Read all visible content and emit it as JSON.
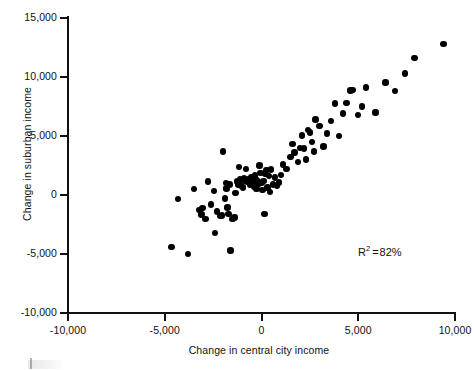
{
  "chart_data": {
    "type": "scatter",
    "title": "",
    "xlabel": "Change in central city income",
    "ylabel": "Change in suburban income",
    "xlim": [
      -10000,
      10000
    ],
    "ylim": [
      -10000,
      15000
    ],
    "grid": false,
    "legend": null,
    "xticks": [
      -10000,
      -5000,
      0,
      5000,
      10000
    ],
    "xtick_labels": [
      "-10,000",
      "-5,000",
      "0",
      "5,000",
      "10,000"
    ],
    "yticks": [
      -10000,
      -5000,
      0,
      5000,
      10000,
      15000
    ],
    "ytick_labels": [
      "-10,000",
      "-5,000",
      "0",
      "5,000",
      "10,000",
      "15,000"
    ],
    "annotations": [
      {
        "name": "r-squared",
        "prefix": "R",
        "superscript": "2",
        "equals": "=",
        "value": "82%",
        "text": "R2 = 82%",
        "x": 6000,
        "y": -3500
      }
    ],
    "marker": {
      "shape": "circle",
      "color": "#000000",
      "size": 6.4
    },
    "n_points": 93,
    "points": [
      [
        -4650,
        -4400
      ],
      [
        -4300,
        -350
      ],
      [
        -3800,
        -5000
      ],
      [
        -3500,
        500
      ],
      [
        -3200,
        -1250
      ],
      [
        -3100,
        -1650
      ],
      [
        -3050,
        -1100
      ],
      [
        -2900,
        -2050
      ],
      [
        -2750,
        1150
      ],
      [
        -2600,
        -800
      ],
      [
        -2450,
        350
      ],
      [
        -2400,
        -3200
      ],
      [
        -2300,
        -1400
      ],
      [
        -2150,
        -1800
      ],
      [
        -2050,
        -1750
      ],
      [
        -2000,
        3700
      ],
      [
        -1900,
        -300
      ],
      [
        -1850,
        1000
      ],
      [
        -1800,
        550
      ],
      [
        -1750,
        -1050
      ],
      [
        -1700,
        -1600
      ],
      [
        -1650,
        900
      ],
      [
        -1600,
        -4700
      ],
      [
        -1500,
        -2050
      ],
      [
        -1400,
        -1900
      ],
      [
        -1350,
        150
      ],
      [
        -1250,
        1150
      ],
      [
        -1200,
        900
      ],
      [
        -1150,
        2350
      ],
      [
        -1100,
        1300
      ],
      [
        -1050,
        800
      ],
      [
        -950,
        650
      ],
      [
        -900,
        1450
      ],
      [
        -850,
        1200
      ],
      [
        -800,
        2200
      ],
      [
        -750,
        1100
      ],
      [
        -700,
        1350
      ],
      [
        -650,
        1000
      ],
      [
        -600,
        850
      ],
      [
        -550,
        1500
      ],
      [
        -500,
        1250
      ],
      [
        -450,
        1100
      ],
      [
        -420,
        900
      ],
      [
        -380,
        700
      ],
      [
        -350,
        1650
      ],
      [
        -300,
        1300
      ],
      [
        -250,
        500
      ],
      [
        -200,
        1150
      ],
      [
        -150,
        950
      ],
      [
        -100,
        2500
      ],
      [
        -50,
        1850
      ],
      [
        0,
        1000
      ],
      [
        50,
        400
      ],
      [
        100,
        1200
      ],
      [
        150,
        -1600
      ],
      [
        200,
        1800
      ],
      [
        250,
        2100
      ],
      [
        300,
        650
      ],
      [
        400,
        1600
      ],
      [
        450,
        250
      ],
      [
        500,
        2150
      ],
      [
        600,
        900
      ],
      [
        700,
        1500
      ],
      [
        800,
        800
      ],
      [
        900,
        1050
      ],
      [
        1000,
        1700
      ],
      [
        1100,
        2600
      ],
      [
        1300,
        2200
      ],
      [
        1500,
        3200
      ],
      [
        1600,
        4300
      ],
      [
        1700,
        3600
      ],
      [
        1900,
        2800
      ],
      [
        2000,
        4000
      ],
      [
        2100,
        5050
      ],
      [
        2200,
        3950
      ],
      [
        2300,
        3000
      ],
      [
        2400,
        5500
      ],
      [
        2500,
        5300
      ],
      [
        2600,
        4500
      ],
      [
        2700,
        3700
      ],
      [
        2800,
        6400
      ],
      [
        3000,
        5850
      ],
      [
        3200,
        4100
      ],
      [
        3400,
        5200
      ],
      [
        3600,
        6250
      ],
      [
        3800,
        7750
      ],
      [
        4000,
        5000
      ],
      [
        4200,
        6900
      ],
      [
        4400,
        7800
      ],
      [
        4600,
        8850
      ],
      [
        4700,
        8900
      ],
      [
        5000,
        6800
      ],
      [
        5200,
        7500
      ],
      [
        5400,
        9100
      ],
      [
        5900,
        7000
      ],
      [
        6400,
        9550
      ],
      [
        6900,
        8800
      ],
      [
        7400,
        10300
      ],
      [
        7900,
        11600
      ],
      [
        9400,
        12800
      ]
    ]
  },
  "axes": {
    "x_title": "Change in central city income",
    "y_title": "Change in suburban income"
  }
}
